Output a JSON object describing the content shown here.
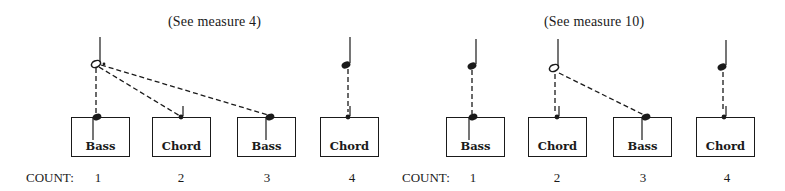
{
  "count_label": "COUNT:",
  "panels": [
    {
      "caption": "(See measure 4)",
      "beats": [
        {
          "count": "1",
          "label": "Bass"
        },
        {
          "count": "2",
          "label": "Chord"
        },
        {
          "count": "3",
          "label": "Bass"
        },
        {
          "count": "4",
          "label": "Chord"
        }
      ],
      "notes_above": [
        {
          "type": "dotted-half-note",
          "beat": 1,
          "connects_to_beats": [
            1,
            2,
            3
          ]
        },
        {
          "type": "quarter-note",
          "beat": 4,
          "connects_to_beats": [
            4
          ]
        }
      ]
    },
    {
      "caption": "(See measure 10)",
      "beats": [
        {
          "count": "1",
          "label": "Bass"
        },
        {
          "count": "2",
          "label": "Chord"
        },
        {
          "count": "3",
          "label": "Bass"
        },
        {
          "count": "4",
          "label": "Chord"
        }
      ],
      "notes_above": [
        {
          "type": "quarter-note",
          "beat": 1,
          "connects_to_beats": [
            1
          ]
        },
        {
          "type": "half-note",
          "beat": 2,
          "connects_to_beats": [
            2,
            3
          ]
        },
        {
          "type": "quarter-note",
          "beat": 4,
          "connects_to_beats": [
            4
          ]
        }
      ]
    }
  ],
  "colors": {
    "ink": "#1a1a1a",
    "background": "#ffffff"
  }
}
